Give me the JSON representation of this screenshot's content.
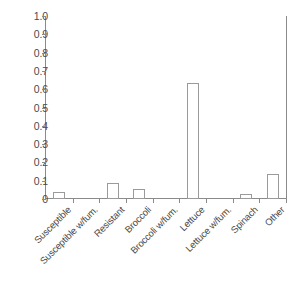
{
  "chart_data": {
    "type": "bar",
    "title": "",
    "xlabel": "",
    "ylabel": "",
    "ylim": [
      0,
      1.0
    ],
    "ytick_labels": [
      "1.0",
      "0.9",
      "0.8",
      "0.7",
      "0.6",
      "0.5",
      "0.4",
      "0.3",
      "0.2",
      "0.1",
      "0"
    ],
    "ytick_values": [
      1.0,
      0.9,
      0.8,
      0.7,
      0.6,
      0.5,
      0.4,
      0.3,
      0.2,
      0.1,
      0
    ],
    "grid": false,
    "legend": "none",
    "categories": [
      "Susceptible",
      "Susceptible w/fum.",
      "Resistant",
      "Broccoli",
      "Broccoli w/fum.",
      "Lettuce",
      "Lettuce w/fum.",
      "Spinach",
      "Other"
    ],
    "values": [
      0.04,
      0.0,
      0.09,
      0.055,
      0.0,
      0.635,
      0.0,
      0.03,
      0.135
    ],
    "bar_style": {
      "fill": "#ffffff",
      "edge": "#9a9a9a"
    },
    "axis_color": "#8a8a8a",
    "text_color": "#4a4a4a"
  }
}
